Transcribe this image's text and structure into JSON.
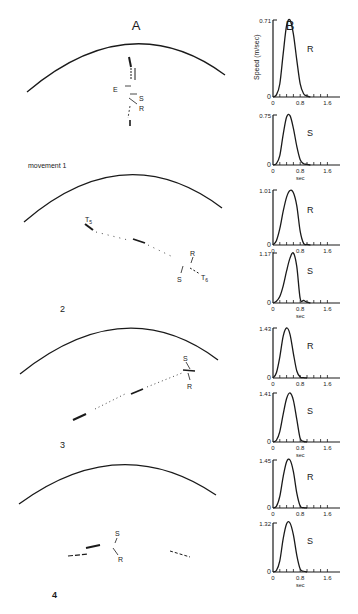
{
  "figure": {
    "panel_a_label": "A",
    "panel_b_label": "B",
    "movement_labels": [
      "movement 1",
      "2",
      "3",
      "4"
    ],
    "panel_a_annotations": [
      {
        "movement": 1,
        "labels": [
          "E",
          "S",
          "R"
        ]
      },
      {
        "movement": 2,
        "labels": [
          "T5",
          "R",
          "S",
          "T6"
        ]
      },
      {
        "movement": 3,
        "labels": [
          "S",
          "R"
        ]
      },
      {
        "movement": 4,
        "labels": [
          "S",
          "R"
        ]
      }
    ]
  },
  "chart_data": [
    {
      "type": "line",
      "title": "movement 1 - R",
      "curve_label": "R",
      "ylabel": "Speed (m/sec)",
      "xlabel": "",
      "ymax_label": "0.71",
      "ylim": [
        0,
        0.71
      ],
      "xlim": [
        0,
        1.9
      ],
      "xticks": [
        "0",
        "0.8",
        "1.6"
      ],
      "x": [
        0,
        0.1,
        0.2,
        0.3,
        0.4,
        0.5,
        0.6,
        0.7,
        0.8,
        0.9,
        1.0,
        1.1
      ],
      "values": [
        0,
        0.02,
        0.12,
        0.4,
        0.66,
        0.71,
        0.58,
        0.34,
        0.12,
        0.03,
        0.01,
        0
      ]
    },
    {
      "type": "line",
      "title": "movement 1 - S",
      "curve_label": "S",
      "ylabel": "",
      "xlabel": "sec",
      "ymax_label": "0.75",
      "ylim": [
        0,
        0.75
      ],
      "xlim": [
        0,
        1.9
      ],
      "xticks": [
        "0",
        "0.8",
        "1.6"
      ],
      "x": [
        0,
        0.1,
        0.2,
        0.3,
        0.4,
        0.5,
        0.6,
        0.7,
        0.8,
        0.9,
        1.0,
        1.1
      ],
      "values": [
        0,
        0.02,
        0.14,
        0.46,
        0.72,
        0.74,
        0.55,
        0.28,
        0.08,
        0.02,
        0.01,
        0
      ]
    },
    {
      "type": "line",
      "title": "movement 2 - R",
      "curve_label": "R",
      "ylabel": "",
      "xlabel": "",
      "ymax_label": "1.01",
      "ylim": [
        0,
        1.01
      ],
      "xlim": [
        0,
        1.9
      ],
      "xticks": [
        "0",
        "0.8",
        "1.6"
      ],
      "x": [
        0,
        0.1,
        0.2,
        0.3,
        0.4,
        0.5,
        0.6,
        0.7,
        0.8,
        0.9,
        1.0,
        1.1
      ],
      "values": [
        0,
        0.08,
        0.3,
        0.62,
        0.88,
        1.0,
        0.96,
        0.72,
        0.25,
        0.03,
        0.01,
        0
      ]
    },
    {
      "type": "line",
      "title": "movement 2 - S",
      "curve_label": "S",
      "ylabel": "",
      "xlabel": "sec",
      "ymax_label": "1.17",
      "ylim": [
        0,
        1.17
      ],
      "xlim": [
        0,
        1.9
      ],
      "xticks": [
        "0",
        "0.8",
        "1.6"
      ],
      "x": [
        0,
        0.1,
        0.2,
        0.3,
        0.4,
        0.5,
        0.6,
        0.7,
        0.8,
        0.9,
        1.0,
        1.1
      ],
      "values": [
        0,
        0.04,
        0.15,
        0.4,
        0.75,
        1.05,
        1.17,
        0.85,
        0.1,
        0.06,
        0.02,
        0
      ]
    },
    {
      "type": "line",
      "title": "movement 3 - R",
      "curve_label": "R",
      "ylabel": "",
      "xlabel": "",
      "ymax_label": "1.43",
      "ylim": [
        0,
        1.43
      ],
      "xlim": [
        0,
        1.9
      ],
      "xticks": [
        "0",
        "0.8",
        "1.6"
      ],
      "x": [
        0,
        0.1,
        0.2,
        0.3,
        0.4,
        0.5,
        0.6,
        0.7,
        0.8,
        0.9,
        1.0
      ],
      "values": [
        0,
        0.15,
        0.6,
        1.2,
        1.43,
        1.25,
        0.7,
        0.2,
        0.03,
        0.01,
        0
      ]
    },
    {
      "type": "line",
      "title": "movement 3 - S",
      "curve_label": "S",
      "ylabel": "",
      "xlabel": "sec",
      "ymax_label": "1.41",
      "ylim": [
        0,
        1.41
      ],
      "xlim": [
        0,
        1.9
      ],
      "xticks": [
        "0",
        "0.8",
        "1.6"
      ],
      "x": [
        0,
        0.1,
        0.2,
        0.3,
        0.4,
        0.5,
        0.6,
        0.7,
        0.8,
        0.9,
        1.0
      ],
      "values": [
        0,
        0.05,
        0.3,
        0.8,
        1.25,
        1.41,
        1.2,
        0.65,
        0.1,
        0.02,
        0
      ]
    },
    {
      "type": "line",
      "title": "movement 4 - R",
      "curve_label": "R",
      "ylabel": "",
      "xlabel": "",
      "ymax_label": "1.45",
      "ylim": [
        0,
        1.45
      ],
      "xlim": [
        0,
        1.9
      ],
      "xticks": [
        "0",
        "0.8",
        "1.6"
      ],
      "x": [
        0,
        0.1,
        0.2,
        0.3,
        0.4,
        0.5,
        0.6,
        0.7,
        0.8,
        0.9,
        1.0
      ],
      "values": [
        0,
        0.05,
        0.35,
        0.95,
        1.4,
        1.45,
        1.1,
        0.45,
        0.06,
        0.01,
        0
      ]
    },
    {
      "type": "line",
      "title": "movement 4 - S",
      "curve_label": "S",
      "ylabel": "",
      "xlabel": "sec",
      "ymax_label": "1.32",
      "ylim": [
        0,
        1.32
      ],
      "xlim": [
        0,
        1.9
      ],
      "xticks": [
        "0",
        "0.8",
        "1.6"
      ],
      "x": [
        0,
        0.1,
        0.2,
        0.3,
        0.4,
        0.5,
        0.6,
        0.7,
        0.8,
        0.9,
        1.0
      ],
      "values": [
        0,
        0.04,
        0.3,
        0.9,
        1.3,
        1.32,
        1.0,
        0.45,
        0.08,
        0.02,
        0
      ]
    }
  ]
}
